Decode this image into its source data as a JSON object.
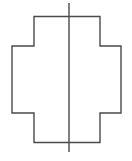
{
  "figure": {
    "title": "Cross shape with vertical line of symmetry",
    "background_color": "#ffffff",
    "width": 132,
    "height": 161,
    "shape": {
      "name": "cross-polygon",
      "kind": "greek-cross",
      "stroke_color": "#4a4a4a",
      "fill_color": "#ffffff",
      "stroke_width": 1.4,
      "points": "34,16.5 100,16.5 100,46 121,46 121,113 100,113 100,142.5 34,142.5 34,113 12,113 12,46 34,46",
      "bounds": {
        "left": 12,
        "top": 16.5,
        "right": 121,
        "bottom": 142.5,
        "arm_left_x": 12,
        "arm_right_x": 121,
        "arm_top_y": 16.5,
        "arm_bottom_y": 142.5,
        "inner_left_x": 34,
        "inner_right_x": 100,
        "inner_top_y": 46,
        "inner_bottom_y": 113
      }
    },
    "symmetry_line": {
      "name": "vertical-symmetry-line",
      "stroke_color": "#4a4a4a",
      "stroke_width": 1.4,
      "x": 69,
      "y_start": 3,
      "y_end": 152,
      "orientation": "vertical"
    }
  }
}
